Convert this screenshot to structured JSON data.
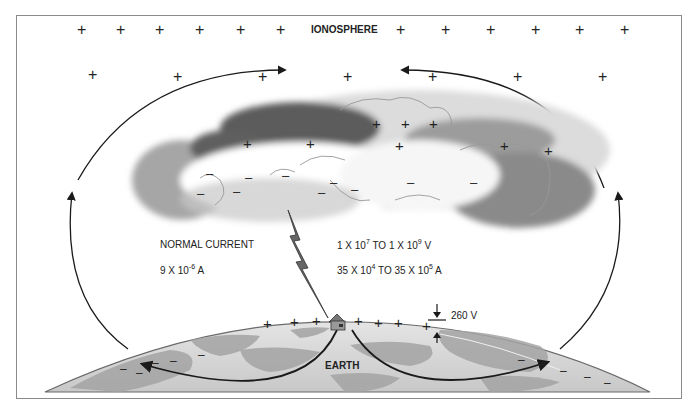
{
  "labels": {
    "ionosphere": "IONOSPHERE",
    "earth": "EARTH",
    "normal_current": "NORMAL CURRENT",
    "normal_current_value": {
      "base": "9 X 10",
      "exp": "-6",
      "unit": " A"
    },
    "lightning_voltage": {
      "a_base": "1 X 10",
      "a_exp": "7",
      "mid": " TO 1 X 10",
      "b_exp": "9",
      "unit": " V"
    },
    "lightning_current": {
      "a_base": "35 X 10",
      "a_exp": "4",
      "mid": " TO 35 X 10",
      "b_exp": "5",
      "unit": " A"
    },
    "surface_potential": "260 V"
  },
  "symbols": {
    "positive": "+",
    "negative": "–"
  },
  "colors": {
    "line": "#1a1a1a",
    "cloud_dark": "#5a5a5a",
    "cloud_mid": "#a8a8a8",
    "cloud_light": "#e6e6e6",
    "earth_light": "#dcdcdc",
    "earth_dark": "#a0a0a0",
    "frame": "#8a8a8a"
  }
}
